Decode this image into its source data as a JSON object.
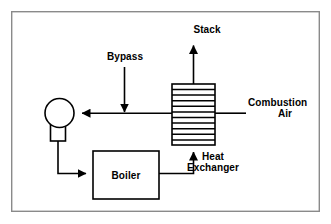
{
  "diagram": {
    "frame": {
      "x": 11,
      "y": 11,
      "width": 309,
      "height": 201,
      "color": "#8a8a8a"
    },
    "line_color": "#000000",
    "background_color": "#ffffff",
    "labels": {
      "stack": "Stack",
      "bypass": "Bypass",
      "combustion_air_line1": "Combustion",
      "combustion_air_line2": "Air",
      "heat_exchanger_line1": "Heat",
      "heat_exchanger_line2": "Exchanger",
      "boiler": "Boiler"
    },
    "nodes": [
      {
        "id": "fan",
        "name": "fan-blower",
        "shape": "circle-with-base",
        "cx": 59,
        "cy": 113,
        "r": 14,
        "base_x": 50,
        "base_y": 120,
        "base_w": 14,
        "base_h": 22
      },
      {
        "id": "boiler",
        "name": "boiler-box",
        "shape": "rectangle",
        "x": 93,
        "y": 151,
        "width": 66,
        "height": 48,
        "label": "Boiler"
      },
      {
        "id": "heat-exchanger",
        "name": "heat-exchanger-box",
        "shape": "finned-rectangle",
        "x": 172,
        "y": 84,
        "width": 43,
        "height": 61,
        "fin_count": 10
      }
    ],
    "flows": [
      {
        "id": "stack-out",
        "name": "stack-outlet-flow",
        "from": "heat-exchanger-top",
        "to": "stack",
        "direction": "up",
        "arrow": true
      },
      {
        "id": "bypass-in",
        "name": "bypass-inlet-flow",
        "from": "bypass",
        "to": "main-duct",
        "direction": "down",
        "arrow": true
      },
      {
        "id": "air-in",
        "name": "combustion-air-inlet-flow",
        "from": "combustion-air",
        "to": "heat-exchanger",
        "direction": "left",
        "arrow": false
      },
      {
        "id": "hx-to-fan",
        "name": "heat-exchanger-to-fan-flow",
        "from": "heat-exchanger",
        "to": "fan",
        "direction": "left",
        "arrow": true
      },
      {
        "id": "fan-to-boiler",
        "name": "fan-to-boiler-flow",
        "from": "fan",
        "to": "boiler",
        "direction": "right",
        "arrow": true
      },
      {
        "id": "boiler-to-hx",
        "name": "boiler-to-heat-exchanger-flow",
        "from": "boiler",
        "to": "heat-exchanger-bottom",
        "direction": "up",
        "arrow": true
      }
    ],
    "label_positions": {
      "stack": {
        "x": 207,
        "y": 32
      },
      "bypass": {
        "x": 128,
        "y": 59
      },
      "combustion_air": {
        "x": 268,
        "y": 109
      },
      "heat_exchanger": {
        "x": 213,
        "y": 162
      },
      "boiler": {
        "x": 126,
        "y": 179
      }
    }
  }
}
